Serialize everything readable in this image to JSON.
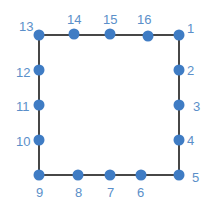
{
  "diagram": {
    "title": "",
    "colors": {
      "point": "#3f7cc4",
      "label": "#5b8fc9",
      "edge": "#1a1a1a",
      "background": "#ffffff"
    },
    "outline": {
      "x": 39,
      "y": 35,
      "width": 140,
      "height": 140
    },
    "points": [
      {
        "label": "1",
        "x": 179,
        "y": 35,
        "lx": 187,
        "ly": 33
      },
      {
        "label": "2",
        "x": 179,
        "y": 70,
        "lx": 187,
        "ly": 75
      },
      {
        "label": "3",
        "x": 179,
        "y": 105,
        "lx": 193,
        "ly": 111
      },
      {
        "label": "4",
        "x": 179,
        "y": 140,
        "lx": 187,
        "ly": 145
      },
      {
        "label": "5",
        "x": 179,
        "y": 175,
        "lx": 192,
        "ly": 182
      },
      {
        "label": "6",
        "x": 141,
        "y": 175,
        "lx": 137,
        "ly": 197
      },
      {
        "label": "7",
        "x": 110,
        "y": 175,
        "lx": 107,
        "ly": 197
      },
      {
        "label": "8",
        "x": 78,
        "y": 175,
        "lx": 75,
        "ly": 197
      },
      {
        "label": "9",
        "x": 39,
        "y": 175,
        "lx": 36,
        "ly": 197
      },
      {
        "label": "10",
        "x": 39,
        "y": 140,
        "lx": 16,
        "ly": 146
      },
      {
        "label": "11",
        "x": 39,
        "y": 105,
        "lx": 16,
        "ly": 111
      },
      {
        "label": "12",
        "x": 39,
        "y": 70,
        "lx": 16,
        "ly": 77
      },
      {
        "label": "13",
        "x": 39,
        "y": 35,
        "lx": 19,
        "ly": 31
      },
      {
        "label": "14",
        "x": 74,
        "y": 34,
        "lx": 67,
        "ly": 24
      },
      {
        "label": "15",
        "x": 110,
        "y": 34,
        "lx": 103,
        "ly": 24
      },
      {
        "label": "16",
        "x": 148,
        "y": 36,
        "lx": 137,
        "ly": 24
      }
    ]
  }
}
